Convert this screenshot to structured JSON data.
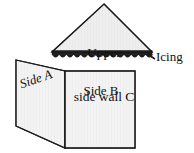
{
  "figure": {
    "name": "cake-box-net-diagram",
    "background_color": "#ffffff",
    "line_color": "#1a1a1a",
    "panel_fill_color": "#f2f2f2",
    "icing_color": "#1c1c1c",
    "labels": {
      "upper_side_wall_line1": "Upper",
      "upper_side_wall_line2": "side wall C",
      "side_a": "Side A",
      "side_b": "Side B",
      "icing": "Icing"
    },
    "parts": [
      {
        "id": "triangle-c",
        "label": "Upper side wall C",
        "shape": "triangle",
        "points": "104,4 152,52 52,52"
      },
      {
        "id": "side-a",
        "label": "Side A",
        "shape": "parallelogram",
        "points": "16,60 65,71 65,148 16,126"
      },
      {
        "id": "side-b",
        "label": "Side B",
        "shape": "rectangle",
        "points": "65,71 135,71 135,148 65,148"
      },
      {
        "id": "icing-band",
        "label": "Icing",
        "shape": "scalloped-band"
      }
    ]
  }
}
